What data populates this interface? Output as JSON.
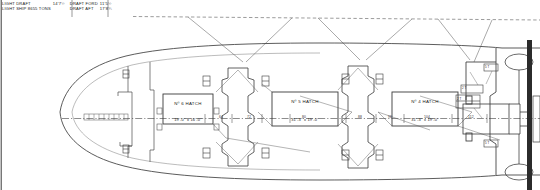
{
  "drawing": {
    "type": "ship-deck-plan",
    "title_notes": {
      "rows": [
        {
          "left_label": "LIGHT DRAFT",
          "left_value": "14'7½",
          "right_label": "DRAFT FORD",
          "right_value": "11'5½"
        },
        {
          "left_label": "LIGHT SHIP 8655 TONS",
          "left_value": "",
          "right_label": "DRAFT AFT",
          "right_value": "17'8¾"
        }
      ]
    },
    "hatches": [
      {
        "name": "Nº 6 HATCH",
        "dimension": "19'-0\" x 16'-0\""
      },
      {
        "name": "Nº 5 HATCH",
        "dimension": "31'-3\" x 19'-0\""
      },
      {
        "name": "Nº 4 HATCH",
        "dimension": "31'-3\" x 19'-0\""
      }
    ],
    "frame_ticks": [
      "64",
      "72",
      "80",
      "88",
      "96",
      "104",
      "112",
      "120"
    ],
    "small_labels": [
      "2 T",
      "5 T",
      "5 T",
      "2 T"
    ],
    "bow_scale_marks": 9
  }
}
